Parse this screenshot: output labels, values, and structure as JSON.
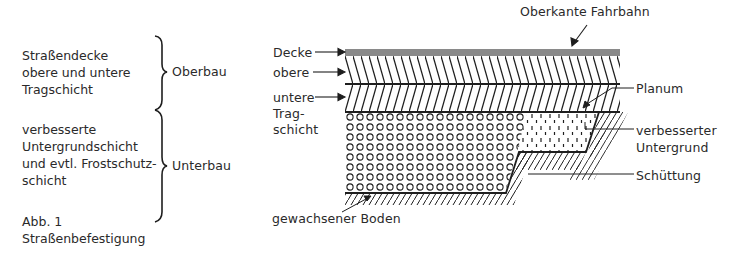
{
  "left_legend": {
    "oberbau_items": [
      "Straßendecke",
      "obere und untere",
      "Tragschicht"
    ],
    "oberbau_label": "Oberbau",
    "unterbau_items": [
      "verbesserte",
      "Untergrundschicht",
      "und evtl. Frostschutz-",
      "schicht"
    ],
    "unterbau_label": "Unterbau",
    "caption": [
      "Abb. 1",
      "Straßenbefestigung"
    ]
  },
  "diagram": {
    "title_label": "Oberkante Fahrbahn",
    "left_labels": {
      "decke": "Decke",
      "obere": "obere",
      "untere": "untere",
      "trag": "Trag-",
      "schicht": "schicht"
    },
    "right_labels": {
      "planum": "Planum",
      "verbesserter": "verbesserter",
      "untergrund": "Untergrund",
      "schuettung": "Schüttung"
    },
    "bottom_label": "gewachsener Boden",
    "colors": {
      "decke_fill": "#8a8a8a",
      "line": "#1e1e1e",
      "text": "#2a2a2a"
    }
  }
}
